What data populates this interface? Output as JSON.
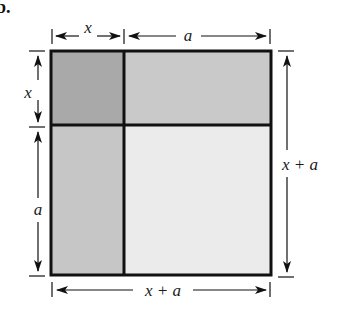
{
  "figure": {
    "part_label": "b.",
    "colors": {
      "square_xx": "#a9a9a9",
      "rect_xa_top": "#c9c9c9",
      "rect_xa_left": "#c6c6c6",
      "square_aa": "#ebebeb",
      "stroke": "#111111"
    },
    "labels": {
      "top_x": "x",
      "top_a": "a",
      "left_x": "x",
      "left_a": "a",
      "right_total": "x + a",
      "bottom_total": "x + a"
    },
    "regions": [
      {
        "name": "x-squared",
        "width": "x",
        "height": "x"
      },
      {
        "name": "x-times-a-top",
        "width": "a",
        "height": "x"
      },
      {
        "name": "a-times-x-left",
        "width": "x",
        "height": "a"
      },
      {
        "name": "a-squared",
        "width": "a",
        "height": "a"
      }
    ]
  }
}
